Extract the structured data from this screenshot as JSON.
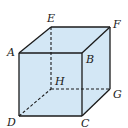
{
  "diagram": {
    "type": "cube",
    "fill_color": "#d3e7f5",
    "line_color": "#1a1a1a",
    "vertices": {
      "A": "A",
      "B": "B",
      "C": "C",
      "D": "D",
      "E": "E",
      "F": "F",
      "G": "G",
      "H": "H"
    },
    "visible_edges": [
      "AB",
      "BC",
      "CD",
      "DA",
      "AE",
      "EF",
      "BF",
      "FG",
      "CG"
    ],
    "hidden_edges": [
      "EH",
      "HG",
      "DH"
    ]
  }
}
